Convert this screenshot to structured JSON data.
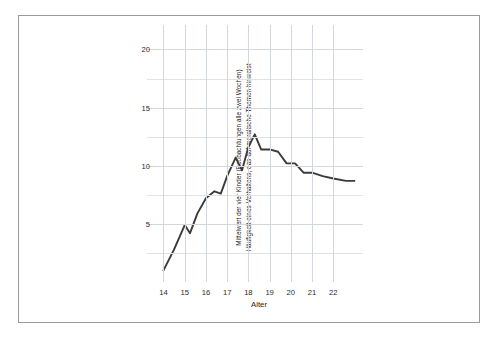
{
  "chart": {
    "ylabel_line1": "Mittelwert der vier Kinder (Beobachtungen alle zwei Wochen)",
    "ylabel_line2": "Häufigkeit eines Verhaltens, das auf moralische Themen hinweist",
    "xlabel": "Alter",
    "line_color": "#3b3b3b",
    "grid_color": "#d2d7dd",
    "frame_color": "#9a9a9a"
  },
  "chart_data": {
    "type": "line",
    "title": "",
    "xlabel": "Alter",
    "ylabel": "Mittelwert der vier Kinder (Beobachtungen alle zwei Wochen) Häufigkeit eines Verhaltens, das auf moralische Themen hinweist",
    "xlim": [
      13.6,
      23.4
    ],
    "ylim": [
      0,
      21.5
    ],
    "xticks": [
      14,
      15,
      16,
      17,
      18,
      19,
      20,
      21,
      22
    ],
    "xtick_labels": [
      "14",
      "15",
      "16",
      "17",
      "18",
      "19",
      "20",
      "21",
      "22"
    ],
    "yticks": [
      5,
      10,
      15,
      20
    ],
    "ytick_labels": [
      "5",
      "10",
      "15",
      "20"
    ],
    "y_gridlines": [
      2.5,
      5,
      7.5,
      10,
      12.5,
      15,
      17.5,
      20
    ],
    "grid": true,
    "legend": false,
    "series": [
      {
        "name": "Mittelwert der vier Kinder",
        "x": [
          14.0,
          14.5,
          15.0,
          15.25,
          15.6,
          16.0,
          16.4,
          16.7,
          17.0,
          17.4,
          17.7,
          18.0,
          18.3,
          18.6,
          19.0,
          19.4,
          19.8,
          20.2,
          20.6,
          21.0,
          21.5,
          22.0,
          22.6,
          23.0
        ],
        "values": [
          1.0,
          2.8,
          4.9,
          4.2,
          5.9,
          7.2,
          7.8,
          7.6,
          9.1,
          10.7,
          9.6,
          11.6,
          12.7,
          11.4,
          11.4,
          11.2,
          10.2,
          10.2,
          9.4,
          9.4,
          9.1,
          8.9,
          8.7,
          8.7
        ]
      }
    ]
  }
}
